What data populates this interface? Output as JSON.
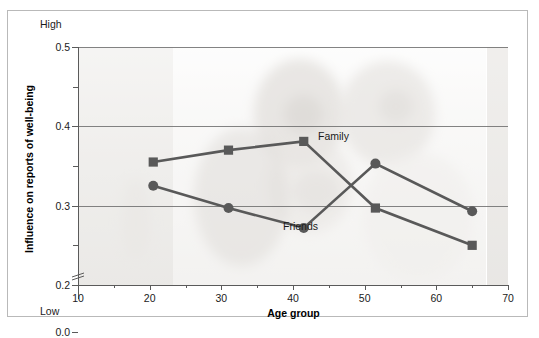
{
  "axis": {
    "y_title": "Influence on reports of well-being",
    "x_title": "Age group",
    "high_label": "High",
    "low_label": "Low",
    "y_ticks": [
      "0.5",
      "0.4",
      "0.3",
      "0.2",
      "0.0"
    ],
    "x_ticks": [
      "10",
      "20",
      "30",
      "40",
      "50",
      "60",
      "70"
    ]
  },
  "series_labels": {
    "family": "Family",
    "friends": "Friends"
  },
  "chart_data": {
    "type": "line",
    "title": "",
    "xlabel": "Age group",
    "ylabel": "Influence on reports of well-being",
    "xlim": [
      10,
      70
    ],
    "ylim": [
      0.2,
      0.5
    ],
    "y_axis_break": true,
    "y_axis_break_from": 0.0,
    "y_axis_break_to": 0.2,
    "grid": true,
    "grid_axis": "y",
    "y_ticks": [
      0.2,
      0.3,
      0.4,
      0.5
    ],
    "y_minor_ticks": [
      0.25,
      0.35,
      0.45
    ],
    "x_ticks": [
      10,
      20,
      30,
      40,
      50,
      60,
      70
    ],
    "x_minor_ticks": [
      15,
      25,
      35,
      45,
      55,
      65
    ],
    "legend_position": "inline-annotation",
    "series": [
      {
        "name": "Family",
        "marker": "square",
        "color": "#595959",
        "x": [
          20.5,
          31,
          41.5,
          51.5,
          65
        ],
        "values": [
          0.355,
          0.37,
          0.381,
          0.297,
          0.25
        ]
      },
      {
        "name": "Friends",
        "marker": "circle",
        "color": "#595959",
        "x": [
          20.5,
          31,
          41.5,
          51.5,
          65
        ],
        "values": [
          0.325,
          0.297,
          0.272,
          0.353,
          0.293
        ]
      }
    ],
    "annotations": [
      {
        "text": "Family",
        "x": 42.5,
        "y": 0.385
      },
      {
        "text": "Friends",
        "x": 39,
        "y": 0.263
      },
      {
        "text": "High",
        "position": "y-axis-top"
      },
      {
        "text": "Low",
        "position": "y-axis-bottom"
      }
    ]
  },
  "colors": {
    "line": "#595959",
    "grid": "#6d6d6d",
    "axis": "#5a5a5a",
    "frame": "#b9b9b9",
    "text": "#1b1b1b"
  }
}
